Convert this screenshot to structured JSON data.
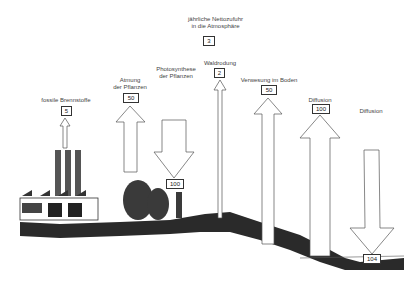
{
  "title": {
    "line1": "jährliche Nettozufuhr",
    "line2": "in die Atmosphäre",
    "value": "3"
  },
  "flows": [
    {
      "label_line1": "fossile Brennstoffe",
      "label_line2": "",
      "value": "5",
      "direction": "up"
    },
    {
      "label_line1": "Atmung",
      "label_line2": "der Pflanzen",
      "value": "50",
      "direction": "up"
    },
    {
      "label_line1": "Photosynthese",
      "label_line2": "der Pflanzen",
      "value": "100",
      "direction": "down"
    },
    {
      "label_line1": "Waldrodung",
      "label_line2": "",
      "value": "2",
      "direction": "up"
    },
    {
      "label_line1": "Verwesung im Boden",
      "label_line2": "",
      "value": "50",
      "direction": "up"
    },
    {
      "label_line1": "Diffusion",
      "label_line2": "",
      "value": "100",
      "direction": "up"
    },
    {
      "label_line1": "Diffusion",
      "label_line2": "",
      "value": "104",
      "direction": "down"
    }
  ],
  "colors": {
    "line": "#555555",
    "ground": "#2a2a2a",
    "background": "#ffffff"
  }
}
